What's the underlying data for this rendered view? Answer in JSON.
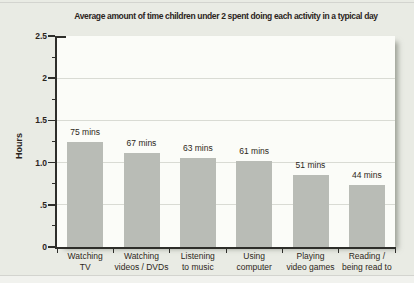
{
  "chart_data": {
    "type": "bar",
    "title": "Average amount of time children under 2 spent doing each activity in a typical day",
    "xlabel": "",
    "ylabel": "Hours",
    "ylim": [
      0,
      2.5
    ],
    "y_tick_labels": [
      {
        "value": 2.5,
        "label": "2.5"
      },
      {
        "value": 2.0,
        "label": "2"
      },
      {
        "value": 1.5,
        "label": "1.5"
      },
      {
        "value": 1.0,
        "label": "1.0"
      },
      {
        "value": 0.5,
        "label": ".5"
      },
      {
        "value": 0,
        "label": "0"
      }
    ],
    "y_minor_tick_step": 0.25,
    "gridline_values": [
      0.5,
      1.0,
      1.5,
      2.0
    ],
    "grid": "horizontal major gridlines, drawn behind bars",
    "legend": "none",
    "categories": [
      [
        "Watching",
        "TV"
      ],
      [
        "Watching",
        "videos / DVDs"
      ],
      [
        "Listening",
        "to music"
      ],
      [
        "Using",
        "computer"
      ],
      [
        "Playing",
        "video games"
      ],
      [
        "Reading /",
        "being read to"
      ]
    ],
    "bars": [
      {
        "category": "Watching TV",
        "minutes": 75,
        "hours": 1.25,
        "label": "75 mins"
      },
      {
        "category": "Watching videos / DVDs",
        "minutes": 67,
        "hours": 1.117,
        "label": "67 mins"
      },
      {
        "category": "Listening to music",
        "minutes": 63,
        "hours": 1.05,
        "label": "63 mins"
      },
      {
        "category": "Using computer",
        "minutes": 61,
        "hours": 1.017,
        "label": "61 mins"
      },
      {
        "category": "Playing video games",
        "minutes": 51,
        "hours": 0.85,
        "label": "51 mins"
      },
      {
        "category": "Reading / being read to",
        "minutes": 44,
        "hours": 0.733,
        "label": "44 mins"
      }
    ]
  },
  "colors": {
    "page_background": "#e9ebe4",
    "plot_background": "#fbfcf8",
    "bar": "#b9bcb6",
    "gridline": "#d9dbd4",
    "axis": "#2e2e2a",
    "text": "#2d2720",
    "title_text": "#2b241c",
    "shadow": "rgba(105,110,98,0.6)"
  }
}
